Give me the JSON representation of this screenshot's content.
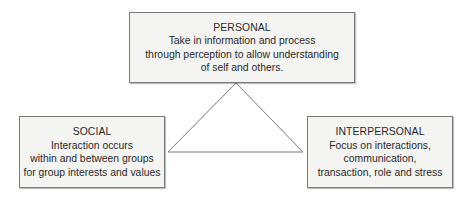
{
  "diagram": {
    "type": "triangle-of-three-systems",
    "connector_color": "#7a7a7a",
    "box_fill": "#f4f4f2",
    "box_border": "#7a7a7a",
    "nodes": [
      {
        "id": "personal",
        "title": "PERSONAL",
        "lines": [
          "Take in information and process",
          "through perception to allow understanding",
          "of self and others."
        ]
      },
      {
        "id": "social",
        "title": "SOCIAL",
        "lines": [
          "Interaction occurs",
          "within and between groups",
          "for group interests and values"
        ]
      },
      {
        "id": "interpersonal",
        "title": "INTERPERSONAL",
        "lines": [
          "Focus on interactions,",
          "communication,",
          "transaction, role and stress"
        ]
      }
    ],
    "edges": [
      {
        "from": "personal",
        "to": "social"
      },
      {
        "from": "social",
        "to": "interpersonal"
      },
      {
        "from": "interpersonal",
        "to": "personal"
      }
    ]
  }
}
